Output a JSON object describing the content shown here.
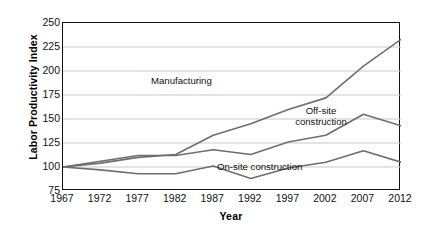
{
  "chart_data": {
    "type": "line",
    "title": "",
    "xlabel": "Year",
    "ylabel": "Labor Productivity Index",
    "x": [
      1967,
      1972,
      1977,
      1982,
      1987,
      1992,
      1997,
      2002,
      2007,
      2012
    ],
    "categories": [
      "1967",
      "1972",
      "1977",
      "1982",
      "1987",
      "1992",
      "1997",
      "2002",
      "2007",
      "2012"
    ],
    "xlim": [
      1967,
      2012
    ],
    "ylim": [
      75,
      250
    ],
    "yticks": [
      75,
      100,
      125,
      150,
      175,
      200,
      225,
      250
    ],
    "ytick_labels": [
      "75",
      "100",
      "125",
      "150",
      "175",
      "200",
      "225",
      "250"
    ],
    "ytick_step": 25,
    "grid": "horizontal",
    "legend": "inline-annotations",
    "series": [
      {
        "name": "Manufacturing",
        "label": "Manufacturing",
        "color": "#6e6e6e",
        "values": [
          100,
          104,
          110,
          113,
          133,
          145,
          160,
          172,
          205,
          233
        ],
        "annotation": {
          "text": "Manufacturing",
          "x": 1987,
          "y": 193
        }
      },
      {
        "name": "Off-site construction",
        "label": "Off-site construction",
        "color": "#6e6e6e",
        "values": [
          100,
          106,
          112,
          112,
          118,
          113,
          126,
          133,
          155,
          143
        ],
        "annotation": {
          "line1": "Off-site",
          "line2": "construction",
          "x": 2004,
          "y": 162
        }
      },
      {
        "name": "On-site construction",
        "label": "On-site construction",
        "color": "#6e6e6e",
        "values": [
          100,
          97,
          93,
          93,
          101,
          88,
          99,
          105,
          117,
          105
        ],
        "annotation": {
          "text": "On-site construction",
          "x": 1999,
          "y": 91
        }
      }
    ],
    "style": {
      "grid_color": "#c9c9c9",
      "axis_color": "#111111",
      "line_color": "#6e6e6e",
      "line_width": 1.6,
      "background": "#ffffff"
    }
  },
  "axes": {
    "y_title": "Labor Productivity Index",
    "x_title": "Year",
    "y_ticks": [
      "250",
      "225",
      "200",
      "175",
      "150",
      "125",
      "100",
      "75"
    ],
    "x_ticks": [
      "1967",
      "1972",
      "1977",
      "1982",
      "1987",
      "1992",
      "1997",
      "2002",
      "2007",
      "2012"
    ]
  },
  "annotations": {
    "manufacturing": "Manufacturing",
    "offsite_line1": "Off-site",
    "offsite_line2": "construction",
    "onsite": "On-site construction"
  }
}
